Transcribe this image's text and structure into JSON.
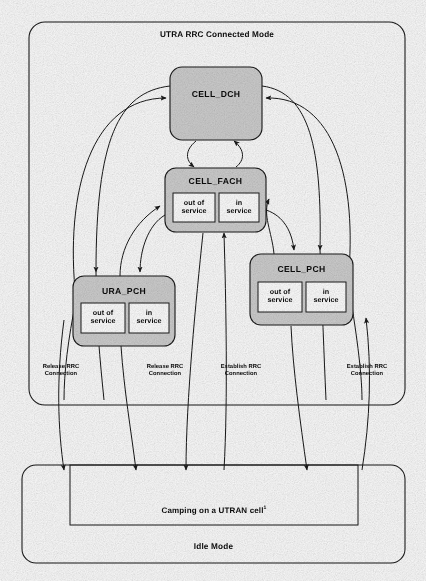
{
  "diagram": {
    "title": "UTRA RRC Connected Mode",
    "idle_mode_title": "Idle Mode",
    "camping_label": "Camping on a UTRAN cell",
    "camping_footnote_marker": "1",
    "colors": {
      "state_fill": "#cfcfcf",
      "substate_fill": "#ffffff",
      "stroke": "#1a1a1a",
      "page_background": "#fdfdfd"
    },
    "states": [
      {
        "id": "cell-dch",
        "label": "CELL_DCH",
        "substates": []
      },
      {
        "id": "cell-fach",
        "label": "CELL_FACH",
        "substates": [
          "out of\nservice",
          "in\nservice"
        ]
      },
      {
        "id": "ura-pch",
        "label": "URA_PCH",
        "substates": [
          "out of\nservice",
          "in\nservice"
        ]
      },
      {
        "id": "cell-pch",
        "label": "CELL_PCH",
        "substates": [
          "out of\nservice",
          "in\nservice"
        ]
      }
    ],
    "substate_labels": {
      "out_of_service": "out of\nservice",
      "in_service": "in\nservice"
    },
    "edge_labels": [
      {
        "id": "release-rrc-left",
        "text": "Release RRC\nConnection"
      },
      {
        "id": "release-rrc-mid",
        "text": "Release RRC\nConnection"
      },
      {
        "id": "establish-rrc-mid",
        "text": "Establish RRC\nConnection"
      },
      {
        "id": "establish-rrc-right",
        "text": "Establish RRC\nConnection"
      }
    ]
  }
}
